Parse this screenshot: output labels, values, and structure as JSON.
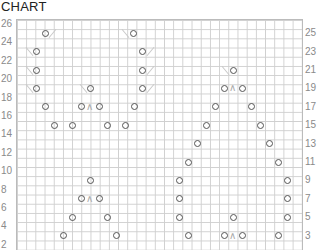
{
  "title": "CHART",
  "left_labels": [
    "26",
    "24",
    "22",
    "20",
    "18",
    "16",
    "14",
    "12",
    "10",
    "8",
    "6",
    "4",
    "2"
  ],
  "right_labels": [
    "25",
    "23",
    "21",
    "19",
    "17",
    "15",
    "13",
    "11",
    "9",
    "7",
    "5",
    "3"
  ],
  "symbols": {
    "yarn_over": "o",
    "k2tog": "/",
    "ssk": "\\",
    "cdd": "∧"
  },
  "chart_data": {
    "type": "knitting-chart",
    "title": "CHART",
    "rows": 26,
    "row_labels_left_even": [
      26,
      24,
      22,
      20,
      18,
      16,
      14,
      12,
      10,
      8,
      6,
      4,
      2
    ],
    "row_labels_right_odd": [
      25,
      23,
      21,
      19,
      17,
      15,
      13,
      11,
      9,
      7,
      5,
      3
    ],
    "grid": true,
    "stitches": [
      {
        "row": 25,
        "yo_x": [
          45,
          133
        ],
        "k2tog_x": [
          52
        ],
        "ssk_x": [
          125
        ]
      },
      {
        "row": 23,
        "yo_x": [
          36,
          142
        ],
        "ssk_x": [
          29
        ],
        "k2tog_x": [
          150
        ]
      },
      {
        "row": 21,
        "yo_x": [
          36,
          142,
          233
        ],
        "ssk_x": [
          29,
          225
        ],
        "k2tog_x": [
          150
        ]
      },
      {
        "row": 19,
        "yo_x": [
          36,
          90,
          142,
          224,
          242
        ],
        "ssk_x": [
          29,
          83
        ],
        "k2tog_x": [
          150
        ],
        "cdd_x": [
          233
        ]
      },
      {
        "row": 17,
        "yo_x": [
          45,
          81,
          99,
          134,
          215,
          251
        ],
        "cdd_x": [
          90
        ]
      },
      {
        "row": 15,
        "yo_x": [
          54,
          72,
          107,
          125,
          206,
          260
        ]
      },
      {
        "row": 13,
        "yo_x": [
          197,
          269
        ]
      },
      {
        "row": 11,
        "yo_x": [
          188,
          278
        ]
      },
      {
        "row": 9,
        "yo_x": [
          90,
          179,
          287
        ]
      },
      {
        "row": 7,
        "yo_x": [
          81,
          99,
          179,
          287
        ],
        "cdd_x": [
          90
        ]
      },
      {
        "row": 5,
        "yo_x": [
          72,
          107,
          179,
          233,
          287
        ]
      },
      {
        "row": 3,
        "yo_x": [
          63,
          116,
          188,
          224,
          242,
          278
        ],
        "cdd_x": [
          233
        ]
      }
    ]
  }
}
